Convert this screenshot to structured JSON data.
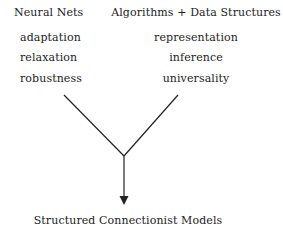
{
  "diagram": {
    "left_column": {
      "title": "Neural Nets",
      "items": [
        "adaptation",
        "relaxation",
        "robustness"
      ]
    },
    "right_column": {
      "title": "Algorithms + Data Structures",
      "items": [
        "representation",
        "inference",
        "universality"
      ]
    },
    "result": "Structured Connectionist Models",
    "colors": {
      "line": "#222222",
      "text": "#222222",
      "background": "#ffffff"
    }
  }
}
